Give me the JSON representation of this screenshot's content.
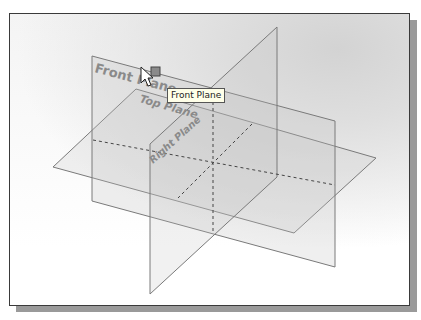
{
  "viewport": {
    "background_top": "#d6d6d6",
    "background_bottom": "#ffffff",
    "frame_color": "#3a3a3a",
    "shadow_color": "#9a9a9a"
  },
  "planes": {
    "front": {
      "label": "Front Plane",
      "edge_color": "#7a7a7a"
    },
    "top": {
      "label": "Top Plane",
      "edge_color": "#7a7a7a"
    },
    "right": {
      "label": "Right Plane",
      "edge_color": "#7a7a7a"
    }
  },
  "label_color": "#8a8a8a",
  "tooltip": {
    "text": "Front Plane"
  },
  "cursor": {
    "icon": "arrow-pointer-icon",
    "selection_marker": "plane-select-square-icon"
  }
}
